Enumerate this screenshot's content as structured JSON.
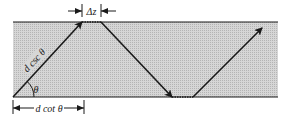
{
  "diagram": {
    "labels": {
      "delta_z": "Δz",
      "hypotenuse": "d csc θ",
      "angle": "θ",
      "base": "d cot θ"
    },
    "colors": {
      "slab_fill": "#c9c9c9",
      "line": "#1a1a1a",
      "background": "#ffffff"
    }
  }
}
